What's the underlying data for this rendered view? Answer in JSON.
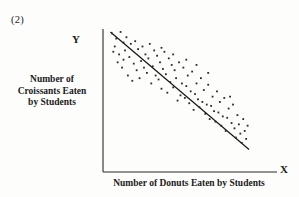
{
  "figure": {
    "number_label": "(2)",
    "y_axis_letter": "Y",
    "x_axis_letter": "X",
    "y_axis_title": "Number of\nCroissants Eaten\nby Students",
    "x_axis_title": "Number of Donuts Eaten by Students",
    "ink_color": "#1b1b1b",
    "background_color": "#fdfdfb"
  },
  "chart_data": {
    "type": "scatter",
    "title": "(2)",
    "xlabel": "Number of Donuts Eaten by Students",
    "ylabel": "Number of Croissants Eaten by Students",
    "grid": false,
    "legend": "none",
    "axis_letters": {
      "x": "X",
      "y": "Y"
    },
    "xlim": [
      0,
      100
    ],
    "ylim": [
      0,
      100
    ],
    "correlation": "strong negative",
    "trend_line": {
      "label": "least-squares fit",
      "x": [
        3,
        98
      ],
      "y": [
        97,
        8
      ]
    },
    "points": [
      [
        4,
        96
      ],
      [
        7,
        92
      ],
      [
        10,
        97
      ],
      [
        6,
        86
      ],
      [
        12,
        89
      ],
      [
        9,
        80
      ],
      [
        14,
        93
      ],
      [
        17,
        88
      ],
      [
        13,
        83
      ],
      [
        20,
        90
      ],
      [
        16,
        78
      ],
      [
        22,
        84
      ],
      [
        8,
        74
      ],
      [
        11,
        70
      ],
      [
        19,
        73
      ],
      [
        25,
        86
      ],
      [
        27,
        80
      ],
      [
        24,
        75
      ],
      [
        30,
        88
      ],
      [
        33,
        83
      ],
      [
        29,
        77
      ],
      [
        35,
        79
      ],
      [
        21,
        68
      ],
      [
        26,
        70
      ],
      [
        15,
        64
      ],
      [
        18,
        60
      ],
      [
        23,
        62
      ],
      [
        28,
        66
      ],
      [
        32,
        71
      ],
      [
        37,
        74
      ],
      [
        40,
        82
      ],
      [
        43,
        77
      ],
      [
        39,
        69
      ],
      [
        45,
        72
      ],
      [
        34,
        64
      ],
      [
        31,
        58
      ],
      [
        36,
        61
      ],
      [
        41,
        65
      ],
      [
        47,
        68
      ],
      [
        50,
        74
      ],
      [
        53,
        70
      ],
      [
        48,
        62
      ],
      [
        44,
        59
      ],
      [
        38,
        54
      ],
      [
        42,
        51
      ],
      [
        46,
        55
      ],
      [
        52,
        58
      ],
      [
        56,
        64
      ],
      [
        59,
        67
      ],
      [
        55,
        56
      ],
      [
        51,
        49
      ],
      [
        49,
        45
      ],
      [
        54,
        47
      ],
      [
        58,
        52
      ],
      [
        62,
        58
      ],
      [
        65,
        62
      ],
      [
        61,
        50
      ],
      [
        57,
        43
      ],
      [
        63,
        46
      ],
      [
        67,
        53
      ],
      [
        70,
        57
      ],
      [
        66,
        44
      ],
      [
        60,
        38
      ],
      [
        64,
        40
      ],
      [
        69,
        42
      ],
      [
        73,
        48
      ],
      [
        76,
        52
      ],
      [
        72,
        41
      ],
      [
        68,
        35
      ],
      [
        74,
        37
      ],
      [
        78,
        44
      ],
      [
        81,
        47
      ],
      [
        77,
        36
      ],
      [
        71,
        31
      ],
      [
        75,
        29
      ],
      [
        80,
        33
      ],
      [
        84,
        39
      ],
      [
        87,
        42
      ],
      [
        83,
        32
      ],
      [
        79,
        26
      ],
      [
        86,
        28
      ],
      [
        90,
        34
      ],
      [
        88,
        24
      ],
      [
        82,
        22
      ],
      [
        91,
        27
      ],
      [
        94,
        31
      ],
      [
        92,
        20
      ],
      [
        89,
        17
      ],
      [
        95,
        22
      ],
      [
        97,
        26
      ],
      [
        96,
        16
      ],
      [
        93,
        13
      ],
      [
        5,
        82
      ],
      [
        12,
        76
      ],
      [
        38,
        85
      ],
      [
        46,
        80
      ],
      [
        55,
        76
      ],
      [
        62,
        72
      ],
      [
        70,
        66
      ],
      [
        85,
        48
      ]
    ]
  }
}
